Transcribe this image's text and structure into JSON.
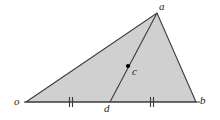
{
  "figure": {
    "type": "geometry-diagram",
    "background_color": "#ffffff",
    "fill_color": "#d0d0d0",
    "stroke_color": "#3a3a3a",
    "point_color": "#000000",
    "label_color": "#1a1a1a",
    "vertices": {
      "o": {
        "label": "o",
        "x": 26,
        "y": 102,
        "label_x": 14,
        "label_y": 97
      },
      "a": {
        "label": "a",
        "x": 157,
        "y": 13,
        "label_x": 160,
        "label_y": 1
      },
      "b": {
        "label": "b",
        "x": 196,
        "y": 102,
        "label_x": 200,
        "label_y": 96
      },
      "d": {
        "label": "d",
        "x": 110,
        "y": 102,
        "label_x": 105,
        "label_y": 104
      },
      "c": {
        "label": "c",
        "x": 128,
        "y": 66,
        "label_x": 132,
        "label_y": 67
      }
    },
    "base_line": {
      "x1": 24,
      "y1": 102,
      "x2": 200,
      "y2": 102
    },
    "triangle_path": "M 26 102 L 157 13 L 196 102 Z",
    "cevian": {
      "x1": 157,
      "y1": 13,
      "x2": 110,
      "y2": 102
    },
    "tick_marks": [
      {
        "name": "tick-od",
        "x": 71,
        "y": 102,
        "count": 2,
        "spacing": 3,
        "half_height": 5
      },
      {
        "name": "tick-db",
        "x": 152,
        "y": 102,
        "count": 2,
        "spacing": 3,
        "half_height": 5
      }
    ],
    "point_marker": {
      "x": 128,
      "y": 66,
      "radius": 2.1
    },
    "stroke_width": 1.1,
    "base_stroke_width": 1.2,
    "tick_stroke_width": 1.1
  }
}
